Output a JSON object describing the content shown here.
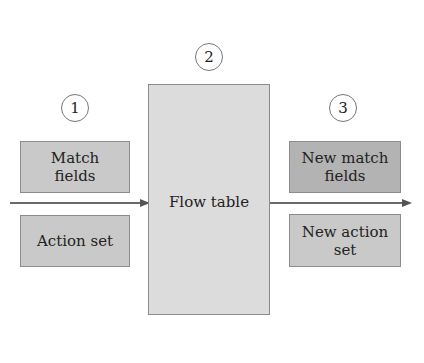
{
  "diagram": {
    "steps": [
      {
        "number": "1",
        "label": "input"
      },
      {
        "number": "2",
        "label": "flow table"
      },
      {
        "number": "3",
        "label": "output"
      }
    ],
    "left": {
      "match_fields": "Match fields",
      "action_set": "Action set"
    },
    "center": {
      "flow_table": "Flow table"
    },
    "right": {
      "new_match_fields": "New match fields",
      "new_action_set": "New action set"
    },
    "colors": {
      "input_boxes": "#c9c9c9",
      "flow_table": "#dcdcdc",
      "output_boxes": "#b3b3b3",
      "arrow": "#6a6a6a"
    }
  }
}
